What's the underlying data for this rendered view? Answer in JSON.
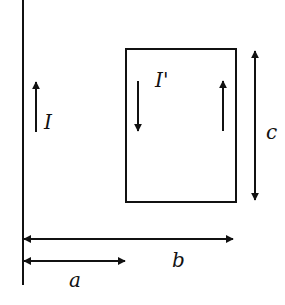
{
  "diagram": {
    "wire": {
      "label": "I",
      "direction": "up"
    },
    "loop": {
      "label": "I'",
      "left_side_direction": "down",
      "right_side_direction": "up"
    },
    "dimensions": {
      "height_label": "c",
      "near_distance_label": "a",
      "far_distance_label": "b"
    },
    "colors": {
      "stroke": "#111111",
      "background": "#ffffff"
    }
  }
}
